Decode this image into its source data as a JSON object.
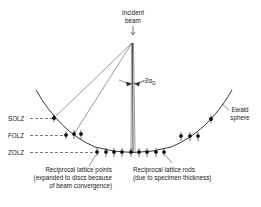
{
  "diagram": {
    "incident_beam": {
      "line1": "Incident",
      "line2": "beam"
    },
    "angle_label": {
      "main": "2α",
      "subscript": "D"
    },
    "zones": {
      "solz": "SOLZ",
      "folz": "FOLZ",
      "zolz": "ZOLZ"
    },
    "ewald": {
      "line1": "Ewald",
      "line2": "sphere"
    },
    "points_note": {
      "line1": "Reciprocal lattice points",
      "line2": "(expanded to discs because",
      "line3": "of beam convergence)"
    },
    "rods_note": {
      "line1": "Reciprocal lattice rods",
      "line2": "(due to specimen thickness)"
    },
    "colors": {
      "ink": "#222222",
      "background": "#ffffff"
    }
  }
}
